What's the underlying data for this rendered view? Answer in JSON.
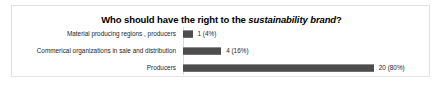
{
  "chart_data": {
    "type": "bar",
    "orientation": "horizontal",
    "title_plain": "Who should have the right to the sustainability brand?",
    "title_parts": {
      "before": "Who should have the right to the ",
      "emphasis": "sustainability brand",
      "after": "?"
    },
    "categories": [
      "Material producing regions , producers",
      "Commerical organizations in sale and distribution",
      "Producers"
    ],
    "values": [
      1,
      4,
      20
    ],
    "percents": [
      4,
      16,
      80
    ],
    "data_labels": [
      "1 (4%)",
      "4 (16%)",
      "20 (80%)"
    ],
    "xlabel": "",
    "ylabel": "",
    "xlim": [
      0,
      26
    ],
    "grid": false,
    "legend": false,
    "bar_color": "#4d4d4d",
    "background_color": "#ffffff",
    "border_color": "#e2e2e2",
    "text_color": "#262626"
  }
}
